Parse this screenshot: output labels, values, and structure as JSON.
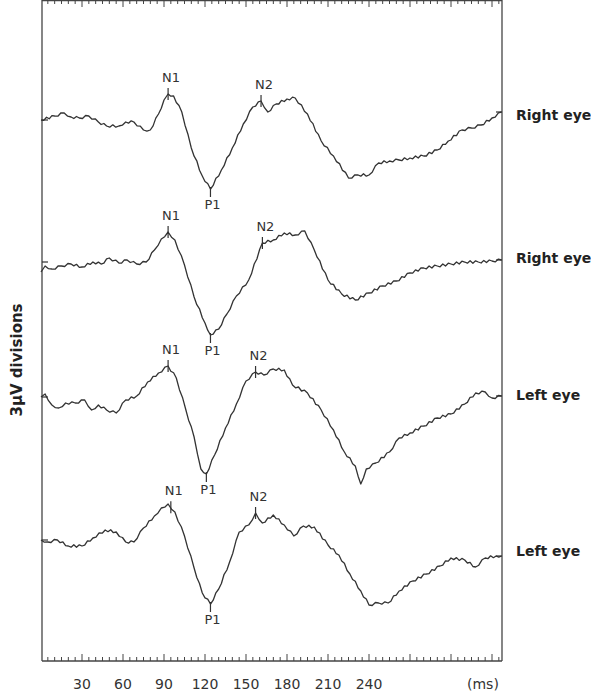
{
  "chart_data": {
    "type": "line",
    "title": "",
    "xlabel": "(ms)",
    "ylabel": "3µV divisions",
    "xlim": [
      0,
      337
    ],
    "x_ticks": [
      30,
      60,
      90,
      120,
      150,
      180,
      210,
      240
    ],
    "minor_tick_interval_ms": 5,
    "grid": false,
    "legend_position": "right (per-trace labels)",
    "peak_markers": [
      "N1",
      "P1",
      "N2"
    ],
    "series": [
      {
        "name": "Right eye",
        "label": "Right eye",
        "baseline_px": 120,
        "peaks_ms": {
          "N1": 93,
          "P1": 124,
          "N2": 161
        },
        "points_ms_px": [
          [
            0,
            120
          ],
          [
            10,
            116
          ],
          [
            17,
            113
          ],
          [
            22,
            117
          ],
          [
            28,
            118
          ],
          [
            35,
            116
          ],
          [
            42,
            122
          ],
          [
            48,
            126
          ],
          [
            57,
            126
          ],
          [
            62,
            122
          ],
          [
            68,
            122
          ],
          [
            75,
            130
          ],
          [
            80,
            130
          ],
          [
            86,
            114
          ],
          [
            90,
            100
          ],
          [
            93,
            94
          ],
          [
            97,
            96
          ],
          [
            103,
            112
          ],
          [
            110,
            148
          ],
          [
            118,
            176
          ],
          [
            124,
            189
          ],
          [
            132,
            170
          ],
          [
            140,
            148
          ],
          [
            148,
            124
          ],
          [
            155,
            107
          ],
          [
            161,
            101
          ],
          [
            166,
            112
          ],
          [
            172,
            104
          ],
          [
            180,
            99
          ],
          [
            186,
            98
          ],
          [
            195,
            114
          ],
          [
            205,
            141
          ],
          [
            214,
            156
          ],
          [
            225,
            178
          ],
          [
            232,
            175
          ],
          [
            240,
            175
          ],
          [
            247,
            163
          ],
          [
            255,
            161
          ],
          [
            262,
            160
          ],
          [
            270,
            158
          ],
          [
            280,
            156
          ],
          [
            290,
            150
          ],
          [
            298,
            141
          ],
          [
            308,
            130
          ],
          [
            315,
            128
          ],
          [
            322,
            125
          ],
          [
            330,
            118
          ],
          [
            337,
            112
          ]
        ]
      },
      {
        "name": "Right eye",
        "label": "Right eye",
        "baseline_px": 262,
        "peaks_ms": {
          "N1": 93,
          "P1": 124,
          "N2": 162
        },
        "points_ms_px": [
          [
            0,
            272
          ],
          [
            3,
            266
          ],
          [
            8,
            269
          ],
          [
            15,
            266
          ],
          [
            22,
            264
          ],
          [
            30,
            267
          ],
          [
            38,
            262
          ],
          [
            44,
            264
          ],
          [
            50,
            258
          ],
          [
            57,
            263
          ],
          [
            63,
            260
          ],
          [
            70,
            264
          ],
          [
            77,
            262
          ],
          [
            83,
            250
          ],
          [
            88,
            239
          ],
          [
            93,
            232
          ],
          [
            98,
            240
          ],
          [
            105,
            265
          ],
          [
            112,
            297
          ],
          [
            120,
            323
          ],
          [
            124,
            335
          ],
          [
            130,
            329
          ],
          [
            136,
            314
          ],
          [
            143,
            296
          ],
          [
            152,
            280
          ],
          [
            162,
            243
          ],
          [
            170,
            240
          ],
          [
            178,
            233
          ],
          [
            186,
            235
          ],
          [
            193,
            231
          ],
          [
            200,
            250
          ],
          [
            210,
            280
          ],
          [
            220,
            294
          ],
          [
            230,
            300
          ],
          [
            240,
            293
          ],
          [
            250,
            286
          ],
          [
            260,
            281
          ],
          [
            270,
            273
          ],
          [
            280,
            268
          ],
          [
            290,
            266
          ],
          [
            300,
            264
          ],
          [
            310,
            262
          ],
          [
            320,
            262
          ],
          [
            330,
            261
          ],
          [
            337,
            260
          ]
        ]
      },
      {
        "name": "Left eye",
        "label": "Left eye",
        "baseline_px": 397,
        "peaks_ms": {
          "N1": 93,
          "P1": 121,
          "N2": 157
        },
        "points_ms_px": [
          [
            0,
            397
          ],
          [
            3,
            394
          ],
          [
            8,
            405
          ],
          [
            13,
            408
          ],
          [
            18,
            403
          ],
          [
            25,
            403
          ],
          [
            32,
            400
          ],
          [
            37,
            410
          ],
          [
            42,
            405
          ],
          [
            48,
            410
          ],
          [
            55,
            413
          ],
          [
            62,
            400
          ],
          [
            70,
            396
          ],
          [
            78,
            382
          ],
          [
            86,
            373
          ],
          [
            93,
            366
          ],
          [
            99,
            378
          ],
          [
            106,
            410
          ],
          [
            112,
            437
          ],
          [
            117,
            469
          ],
          [
            121,
            474
          ],
          [
            127,
            455
          ],
          [
            135,
            428
          ],
          [
            143,
            404
          ],
          [
            150,
            381
          ],
          [
            157,
            372
          ],
          [
            163,
            375
          ],
          [
            170,
            369
          ],
          [
            178,
            370
          ],
          [
            184,
            385
          ],
          [
            195,
            393
          ],
          [
            205,
            410
          ],
          [
            214,
            430
          ],
          [
            222,
            452
          ],
          [
            230,
            466
          ],
          [
            234,
            484
          ],
          [
            238,
            469
          ],
          [
            245,
            463
          ],
          [
            255,
            452
          ],
          [
            262,
            438
          ],
          [
            270,
            433
          ],
          [
            280,
            426
          ],
          [
            290,
            418
          ],
          [
            300,
            414
          ],
          [
            310,
            404
          ],
          [
            318,
            393
          ],
          [
            325,
            392
          ],
          [
            330,
            398
          ],
          [
            337,
            396
          ]
        ]
      },
      {
        "name": "Left eye",
        "label": "Left eye",
        "baseline_px": 540,
        "peaks_ms": {
          "N1": 95,
          "P1": 124,
          "N2": 157
        },
        "points_ms_px": [
          [
            0,
            540
          ],
          [
            5,
            542
          ],
          [
            12,
            540
          ],
          [
            20,
            546
          ],
          [
            30,
            546
          ],
          [
            38,
            538
          ],
          [
            47,
            530
          ],
          [
            55,
            532
          ],
          [
            62,
            542
          ],
          [
            68,
            542
          ],
          [
            75,
            528
          ],
          [
            83,
            516
          ],
          [
            88,
            508
          ],
          [
            93,
            504
          ],
          [
            98,
            512
          ],
          [
            105,
            536
          ],
          [
            112,
            568
          ],
          [
            118,
            593
          ],
          [
            124,
            604
          ],
          [
            130,
            589
          ],
          [
            138,
            562
          ],
          [
            145,
            532
          ],
          [
            152,
            525
          ],
          [
            157,
            513
          ],
          [
            162,
            523
          ],
          [
            170,
            515
          ],
          [
            178,
            525
          ],
          [
            185,
            536
          ],
          [
            192,
            526
          ],
          [
            200,
            527
          ],
          [
            210,
            545
          ],
          [
            218,
            555
          ],
          [
            226,
            574
          ],
          [
            234,
            591
          ],
          [
            240,
            605
          ],
          [
            247,
            603
          ],
          [
            254,
            603
          ],
          [
            262,
            591
          ],
          [
            272,
            581
          ],
          [
            282,
            574
          ],
          [
            292,
            566
          ],
          [
            300,
            558
          ],
          [
            310,
            560
          ],
          [
            318,
            567
          ],
          [
            325,
            558
          ],
          [
            333,
            556
          ],
          [
            337,
            556
          ]
        ]
      }
    ]
  },
  "axis": {
    "y_title": "3µV divisions",
    "x_unit": "(ms)",
    "x_tick_labels": [
      "30",
      "60",
      "90",
      "120",
      "150",
      "180",
      "210",
      "240"
    ]
  },
  "trace_labels": [
    "Right eye",
    "Right eye",
    "Left eye",
    "Left eye"
  ],
  "peak_labels": {
    "n1": "N1",
    "p1": "P1",
    "n2": "N2"
  }
}
